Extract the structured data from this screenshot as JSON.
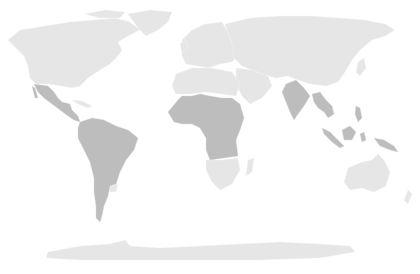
{
  "map": {
    "type": "choropleth-world-map",
    "colors": {
      "background": "#ffffff",
      "base_land": "#e6e6e6",
      "highlighted": "#bdbdbd"
    },
    "highlighted_regions": [
      "Mexico",
      "Central America",
      "South America (excluding Uruguay)",
      "West Africa",
      "Central Africa",
      "East Africa",
      "India",
      "Southeast Asia",
      "Indonesia / Borneo",
      "Papua New Guinea"
    ],
    "base_regions": [
      "North America",
      "Greenland",
      "Europe",
      "North Africa",
      "Southern Africa",
      "Middle East",
      "Russia / Central Asia",
      "China / East Asia",
      "Australia",
      "Antarctica"
    ]
  }
}
